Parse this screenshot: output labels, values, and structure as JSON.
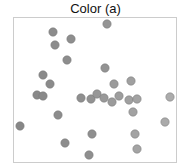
{
  "chart_data": {
    "type": "scatter",
    "title": "Color (a)",
    "xlabel": "",
    "ylabel": "",
    "axes_visible": false,
    "grid": false,
    "frame": {
      "x0": 13,
      "y0": 17,
      "x1": 176,
      "y1": 162,
      "stroke": "#cccccc"
    },
    "marker": {
      "radius": 4.2,
      "stroke": "#777777"
    },
    "color_encoding": "gray shade varies by x position (darker left, lighter right)",
    "points": [
      {
        "x": 107,
        "y": 24,
        "color": "#959595"
      },
      {
        "x": 53,
        "y": 32,
        "color": "#8c8c8c"
      },
      {
        "x": 71,
        "y": 39,
        "color": "#8e8e8e"
      },
      {
        "x": 55,
        "y": 45,
        "color": "#8c8c8c"
      },
      {
        "x": 67,
        "y": 60,
        "color": "#8d8d8d"
      },
      {
        "x": 105,
        "y": 68,
        "color": "#939393"
      },
      {
        "x": 43,
        "y": 75,
        "color": "#8a8a8a"
      },
      {
        "x": 50,
        "y": 84,
        "color": "#8b8b8b"
      },
      {
        "x": 114,
        "y": 84,
        "color": "#9b9b9b"
      },
      {
        "x": 131,
        "y": 81,
        "color": "#a0a0a0"
      },
      {
        "x": 37,
        "y": 95,
        "color": "#898989"
      },
      {
        "x": 43,
        "y": 96,
        "color": "#8a8a8a"
      },
      {
        "x": 81,
        "y": 98,
        "color": "#8f8f8f"
      },
      {
        "x": 91,
        "y": 99,
        "color": "#929292"
      },
      {
        "x": 97,
        "y": 94,
        "color": "#979797"
      },
      {
        "x": 104,
        "y": 98,
        "color": "#999999"
      },
      {
        "x": 112,
        "y": 102,
        "color": "#9b9b9b"
      },
      {
        "x": 119,
        "y": 96,
        "color": "#9d9d9d"
      },
      {
        "x": 129,
        "y": 100,
        "color": "#a0a0a0"
      },
      {
        "x": 137,
        "y": 99,
        "color": "#a3a3a3"
      },
      {
        "x": 170,
        "y": 97,
        "color": "#acacac"
      },
      {
        "x": 133,
        "y": 112,
        "color": "#a2a2a2"
      },
      {
        "x": 58,
        "y": 115,
        "color": "#8c8c8c"
      },
      {
        "x": 20,
        "y": 126,
        "color": "#878787"
      },
      {
        "x": 165,
        "y": 122,
        "color": "#aaaaaa"
      },
      {
        "x": 92,
        "y": 134,
        "color": "#8f8f8f"
      },
      {
        "x": 135,
        "y": 134,
        "color": "#a3a3a3"
      },
      {
        "x": 65,
        "y": 143,
        "color": "#8d8d8d"
      },
      {
        "x": 137,
        "y": 149,
        "color": "#a4a4a4"
      },
      {
        "x": 89,
        "y": 155,
        "color": "#8f8f8f"
      }
    ]
  }
}
